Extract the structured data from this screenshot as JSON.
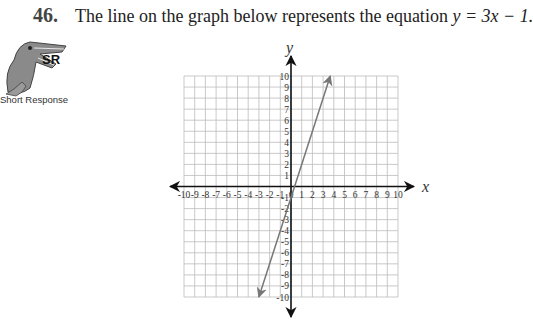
{
  "question": {
    "number": "46.",
    "text_prefix": "The line on the graph below represents the equation ",
    "equation": "y = 3x − 1."
  },
  "badge": {
    "icon": "alligator-icon",
    "code": "SR",
    "label": "Short Response"
  },
  "chart_data": {
    "type": "line",
    "title": "",
    "xlabel": "x",
    "ylabel": "y",
    "xlim": [
      -10,
      10
    ],
    "ylim": [
      -10,
      10
    ],
    "grid": true,
    "x_ticks": [
      "-10",
      "-9",
      "-8",
      "-7",
      "-6",
      "-5",
      "-4",
      "-3",
      "-2",
      "-1",
      "0",
      "1",
      "2",
      "3",
      "4",
      "5",
      "6",
      "7",
      "8",
      "9",
      "10"
    ],
    "y_ticks": [
      "10",
      "9",
      "8",
      "7",
      "6",
      "5",
      "4",
      "3",
      "2",
      "1",
      "-1",
      "-2",
      "-3",
      "-4",
      "-5",
      "-6",
      "-7",
      "-8",
      "-9",
      "-10"
    ],
    "series": [
      {
        "name": "y = 3x - 1",
        "slope": 3,
        "intercept": -1,
        "x": [
          -3,
          3.67
        ],
        "y": [
          -10,
          10
        ],
        "arrows": "both",
        "color": "#777777"
      }
    ]
  }
}
